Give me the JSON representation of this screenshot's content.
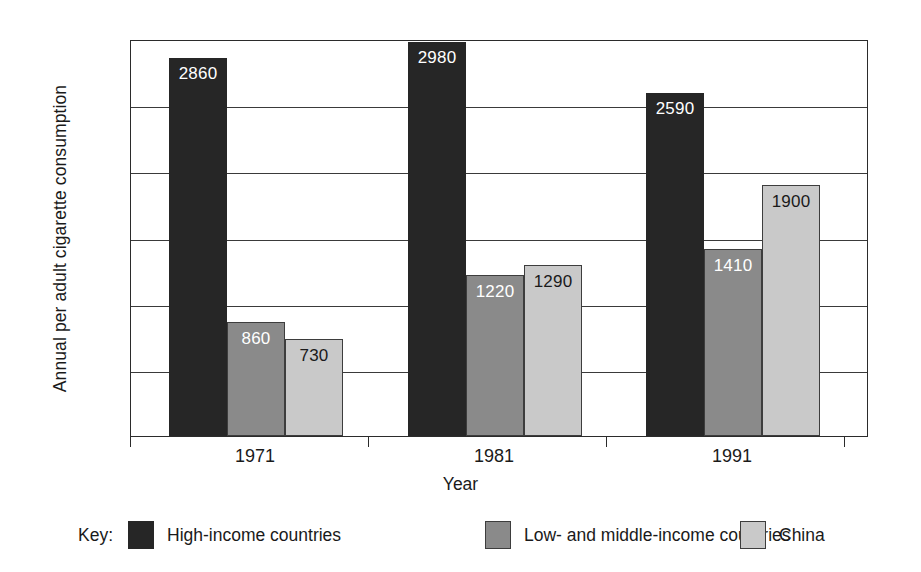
{
  "chart_data": {
    "type": "bar",
    "title": "",
    "xlabel": "Year",
    "ylabel": "Annual per adult cigarette consumption",
    "categories": [
      "1971",
      "1981",
      "1991"
    ],
    "series": [
      {
        "name": "High-income countries",
        "values": [
          2860,
          2980,
          2590
        ],
        "color": "#262626",
        "label_color": "#ffffff"
      },
      {
        "name": "Low- and middle-income countries",
        "values": [
          860,
          1220,
          1410
        ],
        "color": "#8a8a8a",
        "label_color": "#ffffff"
      },
      {
        "name": "China",
        "values": [
          730,
          1290,
          1900
        ],
        "color": "#c9c9c9",
        "label_color": "#1a1a1a"
      }
    ],
    "ylim": [
      0,
      3000
    ],
    "yticks": [
      0,
      500,
      1000,
      1500,
      2000,
      2500,
      3000
    ],
    "ytick_labels": [
      "0",
      "500",
      "1000",
      "1500",
      "2000",
      "2500",
      "3000"
    ],
    "grid": true,
    "legend_position": "bottom",
    "bar_labels_shown": true
  },
  "legend": {
    "key_label": "Key:",
    "entries": [
      {
        "label": "High-income countries",
        "swatch": "black-swatch"
      },
      {
        "label": "Low- and middle-income countries",
        "swatch": "gray-swatch"
      },
      {
        "label": "China",
        "swatch": "light-gray-swatch"
      }
    ]
  }
}
